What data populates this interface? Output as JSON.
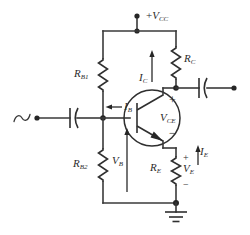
{
  "figure": {
    "name": "voltage-divider-biased-npn-amplifier",
    "background_color": "#ffffff",
    "ink_color": "#2f2f2f"
  },
  "labels": {
    "supply": {
      "prefix": "+",
      "symbol": "V",
      "subscript": "CC"
    },
    "r_b1": {
      "symbol": "R",
      "subscript": "B1"
    },
    "r_b2": {
      "symbol": "R",
      "subscript": "B2"
    },
    "r_c": {
      "symbol": "R",
      "subscript": "C"
    },
    "r_e": {
      "symbol": "R",
      "subscript": "E"
    },
    "i_b": {
      "symbol": "I",
      "subscript": "B"
    },
    "i_c": {
      "symbol": "I",
      "subscript": "C"
    },
    "i_e": {
      "symbol": "I",
      "subscript": "E"
    },
    "v_b": {
      "symbol": "V",
      "subscript": "B"
    },
    "v_e": {
      "symbol": "V",
      "subscript": "E"
    },
    "v_ce": {
      "symbol": "V",
      "subscript": "CE"
    }
  },
  "polarity_marks": {
    "vce_plus": "+",
    "vce_minus": "−",
    "ve_plus": "+",
    "ve_minus": "−"
  },
  "components": [
    {
      "id": "ac-source",
      "type": "ac-voltage-source"
    },
    {
      "id": "input-capacitor",
      "type": "capacitor"
    },
    {
      "id": "output-capacitor",
      "type": "capacitor"
    },
    {
      "id": "resistor-rb1",
      "type": "resistor"
    },
    {
      "id": "resistor-rb2",
      "type": "resistor"
    },
    {
      "id": "resistor-rc",
      "type": "resistor"
    },
    {
      "id": "resistor-re",
      "type": "resistor"
    },
    {
      "id": "transistor-npn",
      "type": "bjt-npn"
    },
    {
      "id": "ground",
      "type": "earth-ground"
    }
  ],
  "current_arrows": [
    {
      "id": "ib-arrow",
      "direction": "left"
    },
    {
      "id": "ic-arrow",
      "direction": "up"
    },
    {
      "id": "ie-arrow",
      "direction": "up"
    },
    {
      "id": "vb-arrow",
      "direction": "up"
    }
  ]
}
